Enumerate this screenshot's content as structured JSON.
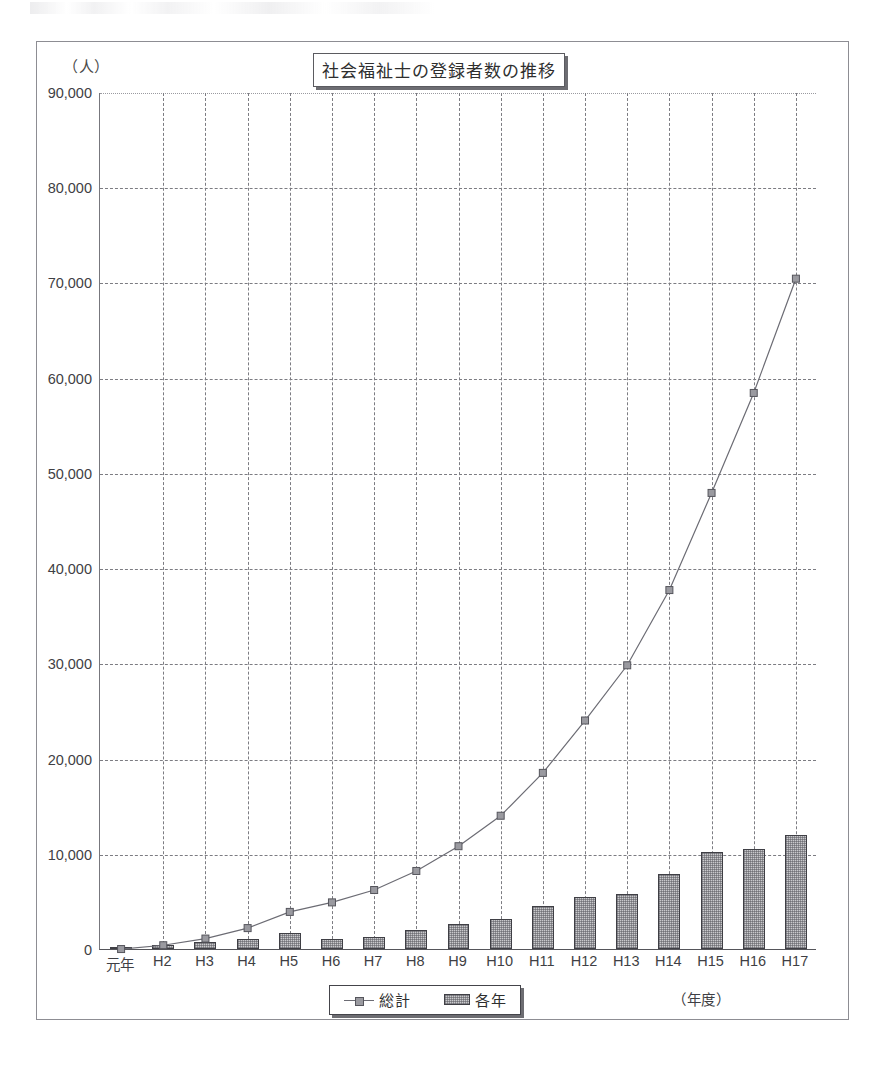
{
  "chart_data": {
    "type": "bar",
    "title": "社会福祉士の登録者数の推移",
    "xlabel": "（年度）",
    "ylabel": "（人）",
    "ylim": [
      0,
      90000
    ],
    "ytick_labels": [
      "90,000",
      "80,000",
      "70,000",
      "60,000",
      "50,000",
      "40,000",
      "30,000",
      "20,000",
      "10,000",
      "0"
    ],
    "ytick_values": [
      90000,
      80000,
      70000,
      60000,
      50000,
      40000,
      30000,
      20000,
      10000,
      0
    ],
    "grid": true,
    "legend_position": "bottom",
    "categories": [
      "元年",
      "H2",
      "H3",
      "H4",
      "H5",
      "H6",
      "H7",
      "H8",
      "H9",
      "H10",
      "H11",
      "H12",
      "H13",
      "H14",
      "H15",
      "H16",
      "H17"
    ],
    "series": [
      {
        "name": "各年",
        "type": "bar",
        "values": [
          100,
          400,
          700,
          1100,
          1700,
          1000,
          1300,
          2000,
          2600,
          3200,
          4500,
          5500,
          5800,
          7900,
          10200,
          10500,
          12000
        ]
      },
      {
        "name": "総計",
        "type": "line",
        "values": [
          100,
          500,
          1200,
          2300,
          4000,
          5000,
          6300,
          8300,
          10900,
          14100,
          18600,
          24100,
          29900,
          37800,
          48000,
          58500,
          70500
        ]
      }
    ]
  },
  "chart": {
    "title": "社会福祉士の登録者数の推移",
    "y_unit": "（人）",
    "x_axis_title": "（年度）",
    "legend": {
      "total_label": "総計",
      "yearly_label": "各年"
    }
  }
}
